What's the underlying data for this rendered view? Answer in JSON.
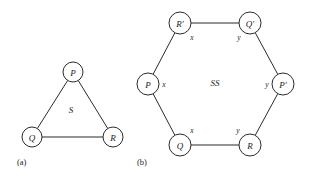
{
  "figure": {
    "background_color": "#ffffff",
    "ink_color": "#2b2b2b",
    "panels": [
      {
        "caption": "(a)",
        "caption_x": 17,
        "caption_y": 162,
        "shape": "triangle",
        "region_label": "S",
        "region_label_x": 71,
        "region_label_y": 110,
        "node_radius": 10,
        "nodes": [
          {
            "label": "P",
            "x": 73,
            "y": 72
          },
          {
            "label": "Q",
            "x": 32,
            "y": 137
          },
          {
            "label": "R",
            "x": 113,
            "y": 137
          }
        ],
        "edges": [
          {
            "from": 0,
            "to": 1
          },
          {
            "from": 0,
            "to": 2
          },
          {
            "from": 1,
            "to": 2
          }
        ],
        "edge_labels": []
      },
      {
        "caption": "(b)",
        "caption_x": 137,
        "caption_y": 162,
        "shape": "hexagon",
        "region_label": "SS",
        "region_label_x": 215,
        "region_label_y": 83,
        "node_radius": 11,
        "nodes": [
          {
            "label": "R′",
            "x": 180,
            "y": 23
          },
          {
            "label": "Q′",
            "x": 250,
            "y": 23
          },
          {
            "label": "P′",
            "x": 283,
            "y": 84
          },
          {
            "label": "R",
            "x": 250,
            "y": 145
          },
          {
            "label": "Q",
            "x": 180,
            "y": 145
          },
          {
            "label": "P",
            "x": 148,
            "y": 84
          }
        ],
        "edges": [
          {
            "from": 0,
            "to": 1
          },
          {
            "from": 1,
            "to": 2
          },
          {
            "from": 2,
            "to": 3
          },
          {
            "from": 3,
            "to": 4
          },
          {
            "from": 4,
            "to": 5
          },
          {
            "from": 5,
            "to": 0
          }
        ],
        "edge_labels": [
          {
            "text": "x",
            "x": 192,
            "y": 37
          },
          {
            "text": "y",
            "x": 239,
            "y": 37
          },
          {
            "text": "y",
            "x": 267,
            "y": 84
          },
          {
            "text": "y",
            "x": 238,
            "y": 130
          },
          {
            "text": "x",
            "x": 192,
            "y": 130
          },
          {
            "text": "x",
            "x": 164,
            "y": 84
          }
        ]
      }
    ]
  }
}
